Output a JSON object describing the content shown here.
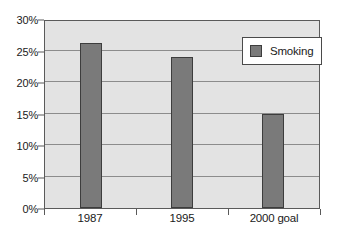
{
  "chart_data": {
    "type": "bar",
    "title": "",
    "subtitle": "",
    "xlabel": "",
    "ylabel": "",
    "categories": [
      "1987",
      "1995",
      "2000 goal"
    ],
    "series": [
      {
        "name": "Smoking",
        "values": [
          26.2,
          24.0,
          15.0
        ]
      }
    ],
    "ylim": [
      0,
      30
    ],
    "ytick_labels": [
      "0%",
      "5%",
      "10%",
      "15%",
      "20%",
      "25%",
      "30%"
    ],
    "ytick_values": [
      0,
      5,
      10,
      15,
      20,
      25,
      30
    ],
    "grid": true,
    "legend_position": "top-right",
    "colors": {
      "bar_fill": "#7a7a7a",
      "bar_border": "#3d3d3d",
      "plot_background": "#e3e3e3",
      "canvas_background": "#ffffff",
      "gridline": "#8c8c8c",
      "frame": "#5a5a5a",
      "text": "#1a1a1a"
    }
  },
  "legend": {
    "entries": [
      {
        "label": "Smoking",
        "swatch_name": "legend-swatch-smoking"
      }
    ]
  }
}
